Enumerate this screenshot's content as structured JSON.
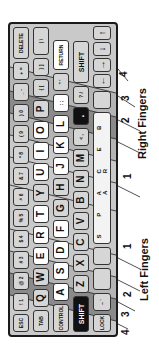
{
  "diagram": {
    "colors": {
      "keyboard_bg": "#c9c9c9",
      "band_dark": "#8a8a8a",
      "band_mid": "#b0b0b0",
      "band_light": "#d4d4d4",
      "key_white": "#ffffff",
      "key_black": "#111111"
    },
    "rows": [
      [
        "ESC",
        "! 1",
        "@ 2",
        "# 3",
        "$ 4",
        "% 5",
        "^ 6",
        "& 7",
        "* 8",
        "( 9",
        ") 0",
        "_ -",
        "+ =",
        "DELETE"
      ],
      [
        "TAB",
        "Q",
        "W",
        "E",
        "R",
        "T",
        "Y",
        "U",
        "I",
        "O",
        "P",
        "{ [",
        "} ]",
        "| \\"
      ],
      [
        "CONTROL",
        "A",
        "S",
        "D",
        "F",
        "G",
        "H",
        "J",
        "K",
        "L",
        ": ;",
        "\" '",
        "RETURN"
      ],
      [
        "SHIFT",
        "Z",
        "X",
        "C",
        "V",
        "B",
        "N",
        "M",
        "< ,",
        ".",
        "? /",
        "SHIFT"
      ],
      [
        "LOCK",
        "~ `",
        "",
        "",
        "S P A C E   B A R",
        "",
        "←",
        "→",
        "↓",
        "↑"
      ]
    ],
    "finger_labels": {
      "left": "Left Fingers",
      "right": "Right Fingers",
      "left_numbers": [
        "4",
        "3",
        "2",
        "1"
      ],
      "right_numbers": [
        "1",
        "2",
        "3",
        "4"
      ]
    }
  }
}
